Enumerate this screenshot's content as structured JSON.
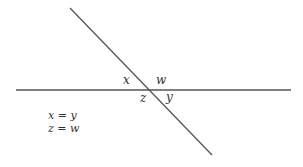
{
  "diagram": {
    "type": "intersecting-lines",
    "lines": {
      "horizontal": {
        "x1": 16,
        "y1": 90,
        "x2": 291,
        "y2": 90
      },
      "diagonal": {
        "x1": 70,
        "y1": 8,
        "x2": 212,
        "y2": 155
      }
    },
    "line_color": "#555555",
    "angle_labels": {
      "top_left": "x",
      "top_right": "w",
      "bottom_left": "z",
      "bottom_right": "y"
    },
    "equations": [
      "x = y",
      "z = w"
    ]
  }
}
